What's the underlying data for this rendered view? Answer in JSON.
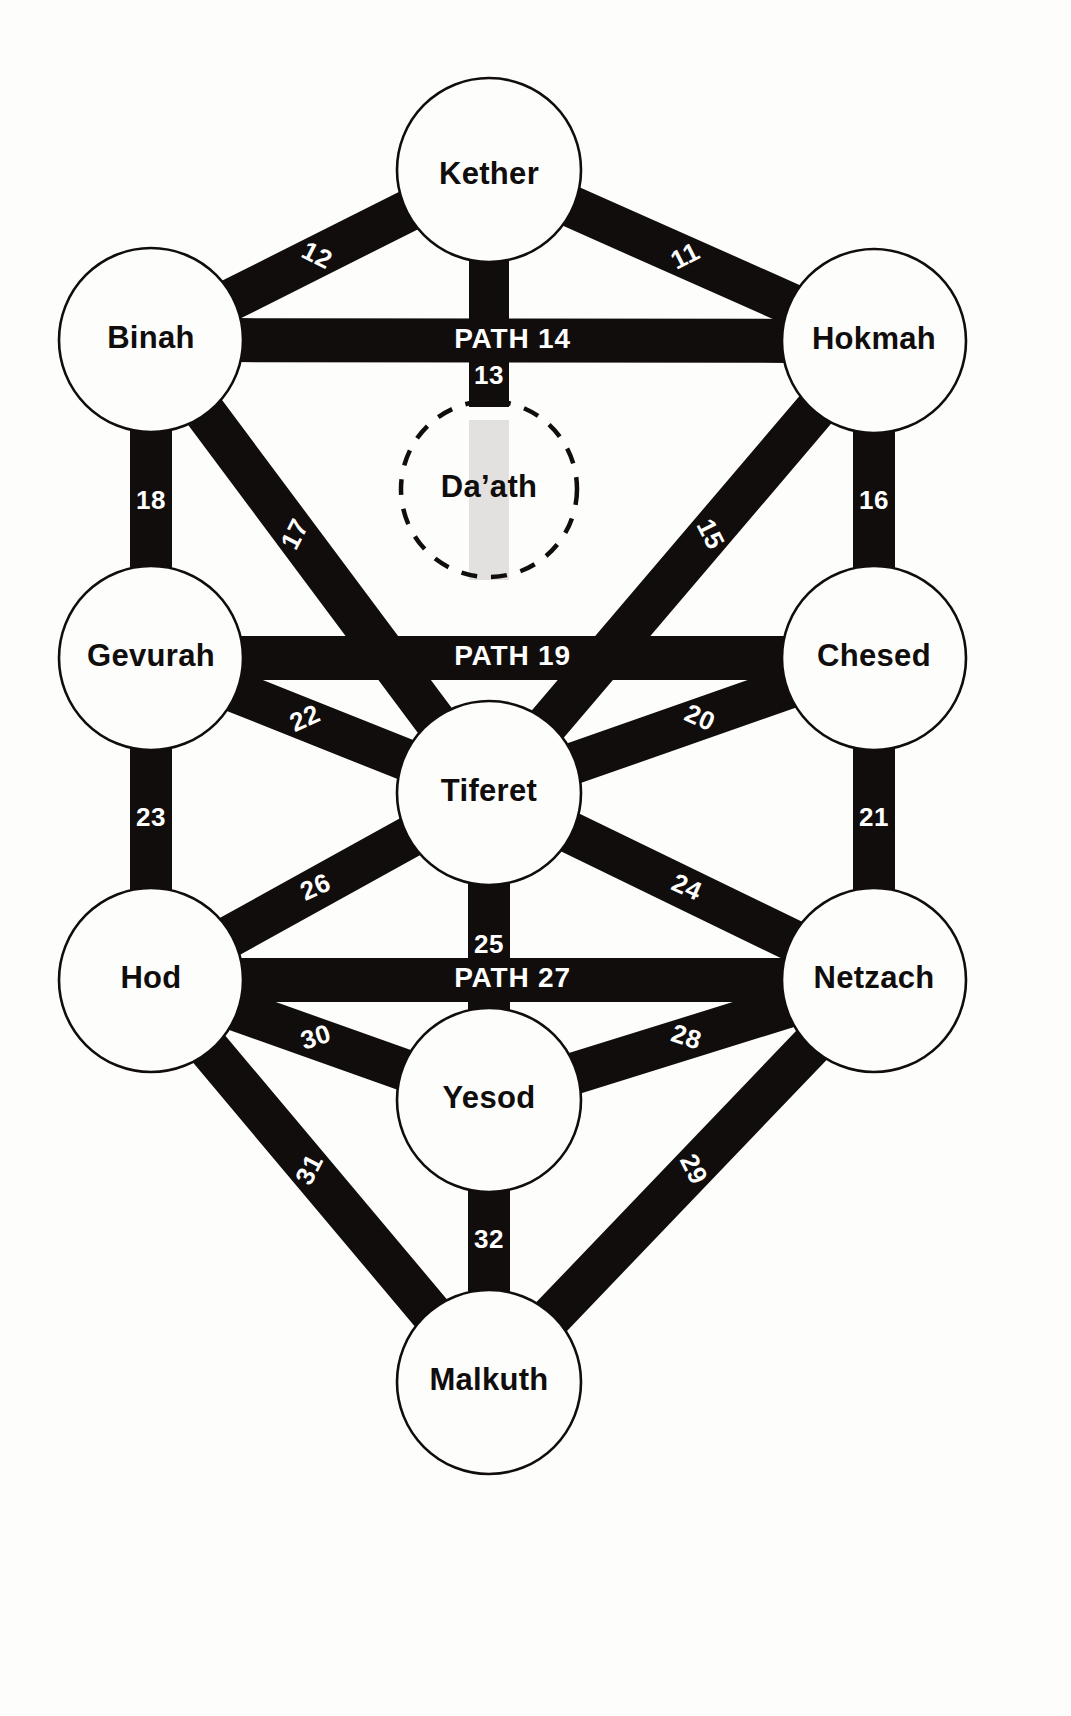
{
  "diagram": {
    "background_color": "#fdfdfc",
    "path_color": "#100d0c",
    "label_color": "#100d0c",
    "path_label_color": "#ffffff",
    "daath_band_color": "#e3e1df"
  },
  "sephirot": [
    {
      "id": "kether",
      "label": "Kether",
      "cx": 489,
      "cy": 170,
      "r": 92,
      "label_dy": 6,
      "dashed": false
    },
    {
      "id": "binah",
      "label": "Binah",
      "cx": 151,
      "cy": 340,
      "r": 92,
      "label_dy": 0,
      "dashed": false
    },
    {
      "id": "hokmah",
      "label": "Hokmah",
      "cx": 874,
      "cy": 341,
      "r": 92,
      "label_dy": 0,
      "dashed": false
    },
    {
      "id": "daath",
      "label": "Da’ath",
      "cx": 489,
      "cy": 489,
      "r": 88,
      "label_dy": 0,
      "dashed": true
    },
    {
      "id": "gevurah",
      "label": "Gevurah",
      "cx": 151,
      "cy": 658,
      "r": 92,
      "label_dy": 0,
      "dashed": false
    },
    {
      "id": "chesed",
      "label": "Chesed",
      "cx": 874,
      "cy": 658,
      "r": 92,
      "label_dy": 0,
      "dashed": false
    },
    {
      "id": "tiferet",
      "label": "Tiferet",
      "cx": 489,
      "cy": 793,
      "r": 92,
      "label_dy": 0,
      "dashed": false
    },
    {
      "id": "hod",
      "label": "Hod",
      "cx": 151,
      "cy": 980,
      "r": 92,
      "label_dy": 0,
      "dashed": false
    },
    {
      "id": "netzach",
      "label": "Netzach",
      "cx": 874,
      "cy": 980,
      "r": 92,
      "label_dy": 0,
      "dashed": false
    },
    {
      "id": "yesod",
      "label": "Yesod",
      "cx": 489,
      "cy": 1100,
      "r": 92,
      "label_dy": 0,
      "dashed": false
    },
    {
      "id": "malkuth",
      "label": "Malkuth",
      "cx": 489,
      "cy": 1382,
      "r": 92,
      "label_dy": 0,
      "dashed": false
    }
  ],
  "paths": [
    {
      "num": "11",
      "label": "11",
      "from": "kether",
      "to": "hokmah",
      "width": 42,
      "label_rotate": -27,
      "label_t": 0.52,
      "style": "round"
    },
    {
      "num": "12",
      "label": "12",
      "from": "kether",
      "to": "binah",
      "width": 42,
      "label_rotate": 27,
      "label_t": 0.52,
      "style": "round"
    },
    {
      "num": "13",
      "label": "13",
      "from": "kether",
      "to": "daath",
      "width": 40,
      "label_rotate": 0,
      "label_t": 0.8,
      "style": "square"
    },
    {
      "num": "14",
      "label": "PATH 14",
      "from": "binah",
      "to": "hokmah",
      "width": 44,
      "label_rotate": 0,
      "label_t": 0.5,
      "style": "round",
      "major": true
    },
    {
      "num": "15",
      "label": "15",
      "from": "hokmah",
      "to": "tiferet",
      "width": 42,
      "label_rotate": 63,
      "label_t": 0.4,
      "style": "round"
    },
    {
      "num": "16",
      "label": "16",
      "from": "hokmah",
      "to": "chesed",
      "width": 42,
      "label_rotate": 0,
      "label_t": 0.52,
      "style": "round"
    },
    {
      "num": "17",
      "label": "17",
      "from": "binah",
      "to": "tiferet",
      "width": 42,
      "label_rotate": -63,
      "label_t": 0.4,
      "style": "round"
    },
    {
      "num": "18",
      "label": "18",
      "from": "binah",
      "to": "gevurah",
      "width": 42,
      "label_rotate": 0,
      "label_t": 0.52,
      "style": "round"
    },
    {
      "num": "19",
      "label": "PATH 19",
      "from": "gevurah",
      "to": "chesed",
      "width": 44,
      "label_rotate": 0,
      "label_t": 0.5,
      "style": "round",
      "major": true
    },
    {
      "num": "20",
      "label": "20",
      "from": "chesed",
      "to": "tiferet",
      "width": 42,
      "label_rotate": 24,
      "label_t": 0.42,
      "style": "round"
    },
    {
      "num": "21",
      "label": "21",
      "from": "chesed",
      "to": "netzach",
      "width": 42,
      "label_rotate": 0,
      "label_t": 0.5,
      "style": "round"
    },
    {
      "num": "22",
      "label": "22",
      "from": "gevurah",
      "to": "tiferet",
      "width": 42,
      "label_rotate": -24,
      "label_t": 0.42,
      "style": "round"
    },
    {
      "num": "23",
      "label": "23",
      "from": "gevurah",
      "to": "hod",
      "width": 42,
      "label_rotate": 0,
      "label_t": 0.5,
      "style": "round"
    },
    {
      "num": "24",
      "label": "24",
      "from": "tiferet",
      "to": "netzach",
      "width": 42,
      "label_rotate": 24,
      "label_t": 0.52,
      "style": "round"
    },
    {
      "num": "25",
      "label": "25",
      "from": "tiferet",
      "to": "yesod",
      "width": 42,
      "label_rotate": 0,
      "label_t": 0.5,
      "style": "round"
    },
    {
      "num": "26",
      "label": "26",
      "from": "tiferet",
      "to": "hod",
      "width": 42,
      "label_rotate": -24,
      "label_t": 0.52,
      "style": "round"
    },
    {
      "num": "27",
      "label": "PATH 27",
      "from": "hod",
      "to": "netzach",
      "width": 44,
      "label_rotate": 0,
      "label_t": 0.5,
      "style": "round",
      "major": true
    },
    {
      "num": "28",
      "label": "28",
      "from": "netzach",
      "to": "yesod",
      "width": 42,
      "label_rotate": 18,
      "label_t": 0.48,
      "style": "round"
    },
    {
      "num": "29",
      "label": "29",
      "from": "netzach",
      "to": "malkuth",
      "width": 42,
      "label_rotate": 63,
      "label_t": 0.46,
      "style": "round"
    },
    {
      "num": "30",
      "label": "30",
      "from": "hod",
      "to": "yesod",
      "width": 42,
      "label_rotate": -18,
      "label_t": 0.48,
      "style": "round"
    },
    {
      "num": "31",
      "label": "31",
      "from": "hod",
      "to": "malkuth",
      "width": 42,
      "label_rotate": -63,
      "label_t": 0.46,
      "style": "round"
    },
    {
      "num": "32",
      "label": "32",
      "from": "yesod",
      "to": "malkuth",
      "width": 42,
      "label_rotate": 0,
      "label_t": 0.5,
      "style": "round"
    }
  ],
  "daath_band": {
    "from": "daath_top",
    "x": 489,
    "y1": 420,
    "y2": 580,
    "width": 40
  }
}
